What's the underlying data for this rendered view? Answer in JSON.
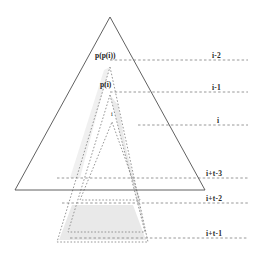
{
  "figure": {
    "name": "nested-pyramid-tree-diagram",
    "width": 255,
    "height": 254,
    "background_color": "#ffffff",
    "line_color": "#555555",
    "dotted_color": "#8a8a8a",
    "shade_color": "#e4e4e4"
  },
  "outer_triangle": {
    "label": "outer-solid-triangle",
    "apex": {
      "x": 110,
      "y": 17
    },
    "left_base": {
      "x": 15,
      "y": 190
    },
    "right_base": {
      "x": 205,
      "y": 190
    },
    "style": "solid"
  },
  "nested_triangles": [
    {
      "id": "p-p-i",
      "label": "p(p(i))",
      "apex": {
        "x": 110,
        "y": 67
      },
      "left_base": {
        "x": 57,
        "y": 242
      },
      "right_base": {
        "x": 148,
        "y": 242
      },
      "style": "dotted"
    },
    {
      "id": "p-i",
      "label": "p(i)",
      "apex": {
        "x": 110,
        "y": 95
      },
      "left_base": {
        "x": 68,
        "y": 232
      },
      "right_base": {
        "x": 145,
        "y": 232
      },
      "style": "dotted"
    },
    {
      "id": "i",
      "label": "i",
      "apex": {
        "x": 112,
        "y": 122
      },
      "left_base": {
        "x": 80,
        "y": 200
      },
      "right_base": {
        "x": 140,
        "y": 200
      },
      "style": "dotted"
    }
  ],
  "level_lines": [
    {
      "id": "level-i-minus-2",
      "label": "i-2",
      "y": 60,
      "x_start": 110,
      "x_end": 248,
      "label_x": 212,
      "label_y": 51
    },
    {
      "id": "level-i-minus-1",
      "label": "i-1",
      "y": 92,
      "x_start": 110,
      "x_end": 248,
      "label_x": 212,
      "label_y": 83
    },
    {
      "id": "level-i",
      "label": "i",
      "y": 125,
      "x_start": 138,
      "x_end": 248,
      "label_x": 216,
      "label_y": 116
    },
    {
      "id": "level-i-t-3",
      "label": "i+t-3",
      "y": 178,
      "x_start": 57,
      "x_end": 248,
      "label_x": 206,
      "label_y": 169
    },
    {
      "id": "level-i-t-2",
      "label": "i+t-2",
      "y": 203,
      "x_start": 62,
      "x_end": 248,
      "label_x": 206,
      "label_y": 194
    },
    {
      "id": "level-i-t-1",
      "label": "i+t-1",
      "y": 238,
      "x_start": 70,
      "x_end": 248,
      "label_x": 206,
      "label_y": 228
    }
  ],
  "shaded_regions": [
    {
      "id": "shade-right-band-upper",
      "description": "shaded band between p(i) right edge and p(p(i)) right edge"
    },
    {
      "id": "shade-left-band-upper",
      "description": "shaded band between p(p(i)) left edge and p(i) left edge"
    },
    {
      "id": "shade-bottom-trapezoid",
      "description": "shaded trapezoid at bottom of p(p(i)) triangle"
    }
  ],
  "node_labels": [
    {
      "id": "label-p-p-i",
      "text": "p(p(i))",
      "x": 95,
      "y": 55
    },
    {
      "id": "label-p-i",
      "text": "p(i)",
      "x": 100,
      "y": 84
    },
    {
      "id": "label-i",
      "text": "i",
      "x": 110,
      "y": 112
    }
  ]
}
